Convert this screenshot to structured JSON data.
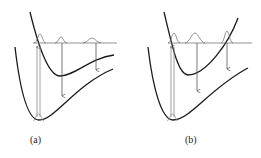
{
  "panels": [
    {
      "label": "(a)",
      "description": "Upper potential curve minimum displaced; vertical excitation from ground state, emission arrows to lower curve"
    },
    {
      "label": "(b)",
      "description": "Upper potential curve bound steeply on both sides; vertical excitation and emission arrows"
    }
  ],
  "colors": {
    "curve": "#1a1a1a",
    "arrow": "#555555",
    "line": "#777777"
  }
}
